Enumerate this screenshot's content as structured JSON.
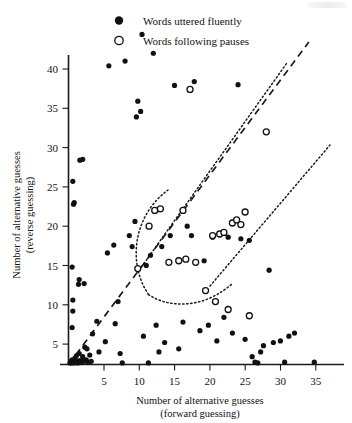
{
  "legend": {
    "position": "top-center",
    "entries": [
      {
        "marker": "filled-circle",
        "label": "Words uttered fluently"
      },
      {
        "marker": "open-circle",
        "label": "Words following pauses"
      }
    ]
  },
  "chart_data": {
    "type": "scatter",
    "title": "",
    "xlabel_line1": "Number of alternative guesses",
    "xlabel_line2": "(forward guessing)",
    "ylabel_line1": "Number of alternative guesses",
    "ylabel_line2": "(reverse guessing)",
    "xlim": [
      0,
      38
    ],
    "ylim": [
      0,
      44
    ],
    "xticks": [
      5,
      10,
      15,
      20,
      25,
      30,
      35
    ],
    "yticks": [
      5,
      10,
      15,
      20,
      25,
      30,
      35,
      40
    ],
    "grid": false,
    "series": [
      {
        "name": "Words uttered fluently",
        "marker": "filled-circle",
        "points": [
          [
            0.2,
            0.2
          ],
          [
            0.3,
            0.4
          ],
          [
            0.4,
            0.2
          ],
          [
            0.5,
            0.6
          ],
          [
            0.6,
            0.3
          ],
          [
            0.8,
            0.2
          ],
          [
            0.9,
            0.8
          ],
          [
            1.0,
            0.3
          ],
          [
            1.1,
            1.1
          ],
          [
            1.2,
            0.4
          ],
          [
            1.3,
            0.2
          ],
          [
            1.5,
            1.4
          ],
          [
            1.6,
            0.5
          ],
          [
            1.8,
            0.3
          ],
          [
            2.0,
            1.0
          ],
          [
            2.1,
            0.4
          ],
          [
            2.3,
            2.2
          ],
          [
            2.5,
            0.6
          ],
          [
            2.7,
            0.3
          ],
          [
            3.0,
            1.2
          ],
          [
            3.2,
            0.4
          ],
          [
            0.5,
            4.7
          ],
          [
            0.6,
            6.8
          ],
          [
            0.6,
            8.2
          ],
          [
            0.5,
            12.4
          ],
          [
            0.7,
            20.4
          ],
          [
            0.8,
            20.6
          ],
          [
            0.6,
            23.3
          ],
          [
            1.4,
            10.2
          ],
          [
            1.5,
            10.8
          ],
          [
            2.2,
            10.3
          ],
          [
            1.6,
            26.0
          ],
          [
            2.0,
            26.1
          ],
          [
            2.6,
            2.0
          ],
          [
            3.4,
            3.9
          ],
          [
            4.0,
            5.5
          ],
          [
            4.3,
            1.6
          ],
          [
            5.2,
            2.9
          ],
          [
            5.5,
            14.2
          ],
          [
            5.7,
            38.0
          ],
          [
            6.4,
            15.2
          ],
          [
            6.6,
            5.2
          ],
          [
            7.0,
            8.0
          ],
          [
            7.3,
            1.4
          ],
          [
            7.6,
            0.2
          ],
          [
            8.0,
            38.6
          ],
          [
            8.6,
            16.4
          ],
          [
            9.0,
            15.0
          ],
          [
            9.4,
            18.2
          ],
          [
            9.6,
            31.5
          ],
          [
            9.8,
            33.5
          ],
          [
            10.2,
            32.2
          ],
          [
            10.4,
            42.0
          ],
          [
            10.6,
            3.6
          ],
          [
            11.0,
            12.6
          ],
          [
            11.3,
            0.2
          ],
          [
            11.6,
            13.9
          ],
          [
            12.0,
            39.6
          ],
          [
            12.4,
            5.0
          ],
          [
            12.8,
            1.6
          ],
          [
            13.2,
            15.0
          ],
          [
            13.6,
            2.8
          ],
          [
            14.4,
            16.4
          ],
          [
            15.0,
            35.5
          ],
          [
            15.6,
            2.0
          ],
          [
            16.2,
            5.4
          ],
          [
            16.8,
            17.6
          ],
          [
            17.4,
            16.4
          ],
          [
            17.8,
            36.0
          ],
          [
            18.6,
            4.3
          ],
          [
            19.2,
            13.2
          ],
          [
            19.8,
            5.0
          ],
          [
            20.4,
            16.2
          ],
          [
            21.0,
            3.0
          ],
          [
            22.0,
            6.0
          ],
          [
            22.6,
            16.2
          ],
          [
            23.2,
            4.0
          ],
          [
            24.0,
            35.6
          ],
          [
            24.4,
            16.0
          ],
          [
            25.0,
            3.2
          ],
          [
            25.6,
            15.8
          ],
          [
            26.0,
            1.0
          ],
          [
            26.4,
            0.3
          ],
          [
            26.8,
            0.2
          ],
          [
            27.2,
            1.6
          ],
          [
            27.6,
            2.4
          ],
          [
            28.4,
            12.0
          ],
          [
            29.0,
            2.8
          ],
          [
            30.0,
            3.0
          ],
          [
            30.6,
            0.3
          ],
          [
            31.2,
            3.6
          ],
          [
            32.0,
            4.0
          ],
          [
            34.8,
            0.3
          ]
        ]
      },
      {
        "name": "Words following pauses",
        "marker": "open-circle",
        "points": [
          [
            9.8,
            12.2
          ],
          [
            11.4,
            17.6
          ],
          [
            12.2,
            19.6
          ],
          [
            13.0,
            19.8
          ],
          [
            14.2,
            13.0
          ],
          [
            15.6,
            13.2
          ],
          [
            16.2,
            19.6
          ],
          [
            16.6,
            13.4
          ],
          [
            17.2,
            35.0
          ],
          [
            18.0,
            13.0
          ],
          [
            19.4,
            9.4
          ],
          [
            20.4,
            16.4
          ],
          [
            20.8,
            8.0
          ],
          [
            21.4,
            16.6
          ],
          [
            22.0,
            16.8
          ],
          [
            22.6,
            7.0
          ],
          [
            23.2,
            18.0
          ],
          [
            23.8,
            18.4
          ],
          [
            24.4,
            17.8
          ],
          [
            25.0,
            19.4
          ],
          [
            25.6,
            6.2
          ],
          [
            28.0,
            29.6
          ]
        ]
      }
    ],
    "reference_lines": [
      {
        "name": "identity-diagonal",
        "style": "dashed",
        "from": [
          0.0,
          0.0
        ],
        "to": [
          34.0,
          41.0
        ]
      },
      {
        "name": "upper-envelope",
        "style": "dotted",
        "from": [
          10.0,
          12.0
        ],
        "to": [
          31.0,
          41.5
        ]
      },
      {
        "name": "lower-envelope",
        "style": "dotted",
        "from": [
          20.0,
          10.0
        ],
        "to": [
          37.0,
          30.5
        ]
      },
      {
        "name": "funnel-left-arc",
        "style": "dotted",
        "description": "curved arc enclosing the pause-word band, vertex near (11,10)"
      }
    ]
  }
}
